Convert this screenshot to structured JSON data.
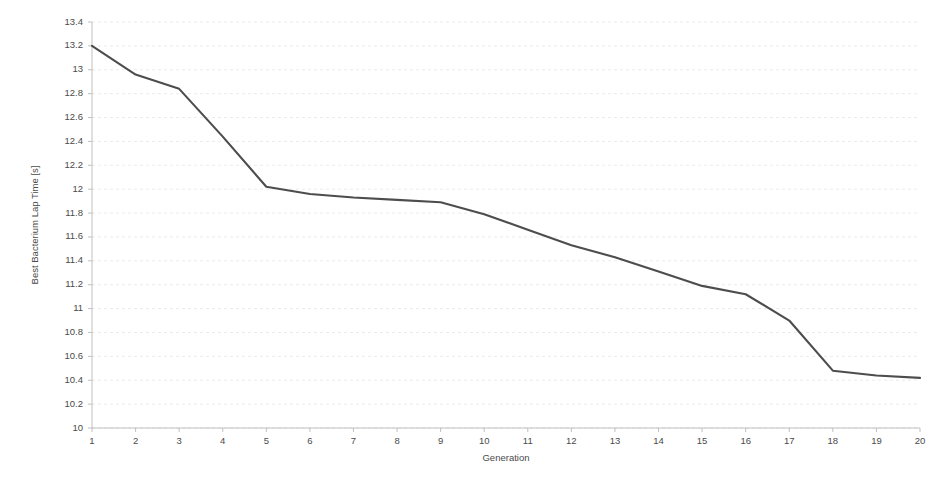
{
  "chart_data": {
    "type": "line",
    "title": "",
    "subtitle": "",
    "xlabel": "Generation",
    "ylabel": "Best Bacterium Lap Time [s]",
    "x": [
      1,
      2,
      3,
      4,
      5,
      6,
      7,
      8,
      9,
      10,
      11,
      12,
      13,
      14,
      15,
      16,
      17,
      18,
      19,
      20
    ],
    "categories": [
      "1",
      "2",
      "3",
      "4",
      "5",
      "6",
      "7",
      "8",
      "9",
      "10",
      "11",
      "12",
      "13",
      "14",
      "15",
      "16",
      "17",
      "18",
      "19",
      "20"
    ],
    "series": [
      {
        "name": "Best Bacterium Lap Time",
        "color": "#4d4d4d",
        "values": [
          13.2,
          12.96,
          12.84,
          12.44,
          12.02,
          11.96,
          11.93,
          11.91,
          11.89,
          11.79,
          11.66,
          11.53,
          11.43,
          11.31,
          11.19,
          11.12,
          10.9,
          10.48,
          10.44,
          10.42
        ]
      }
    ],
    "xlim": [
      1,
      20
    ],
    "ylim": [
      10,
      13.4
    ],
    "xticks": [
      "1",
      "2",
      "3",
      "4",
      "5",
      "6",
      "7",
      "8",
      "9",
      "10",
      "11",
      "12",
      "13",
      "14",
      "15",
      "16",
      "17",
      "18",
      "19",
      "20"
    ],
    "yticks": [
      "10",
      "10.2",
      "10.4",
      "10.6",
      "10.8",
      "11",
      "11.2",
      "11.4",
      "11.6",
      "11.8",
      "12",
      "12.2",
      "12.4",
      "12.6",
      "12.8",
      "13",
      "13.2",
      "13.4"
    ],
    "ytick_values": [
      10,
      10.2,
      10.4,
      10.6,
      10.8,
      11,
      11.2,
      11.4,
      11.6,
      11.8,
      12,
      12.2,
      12.4,
      12.6,
      12.8,
      13,
      13.2,
      13.4
    ],
    "grid": true,
    "grid_axis": "y",
    "legend": false,
    "legend_position": "none",
    "background_color": "#ffffff",
    "grid_color": "#e3e3e3",
    "axis_color": "#b9b9b9",
    "text_color": "#4a4a4a"
  }
}
